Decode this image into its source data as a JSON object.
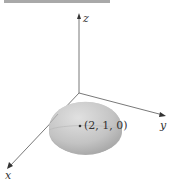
{
  "diagram": {
    "axes": {
      "x_label": "x",
      "y_label": "y",
      "z_label": "z"
    },
    "point": {
      "label": "(2, 1, 0)"
    },
    "surface": "hemisphere",
    "colors": {
      "axis": "#555555",
      "surface_light": "#d8d8d8",
      "surface_dark": "#9a9a9a",
      "top_bar": "#a9a9a9"
    }
  }
}
